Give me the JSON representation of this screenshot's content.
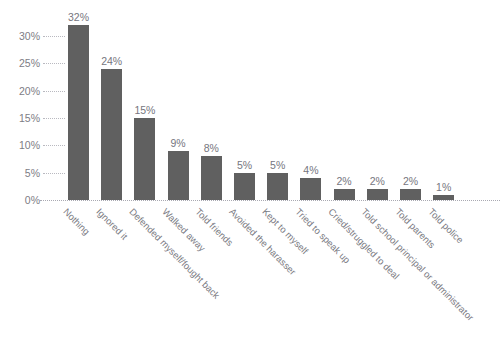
{
  "chart": {
    "title_remnant": "",
    "background_color": "#ffffff",
    "bar_color": "#606060",
    "axis_text_color": "#7b7b83",
    "gridline_color": "#b9b9c0"
  },
  "chart_data": {
    "type": "bar",
    "title": "",
    "xlabel": "",
    "ylabel": "",
    "ylim": [
      0,
      32
    ],
    "grid": "dotted-stubs-and-zero-baseline",
    "legend": "none",
    "orientation": "vertical",
    "value_suffix": "%",
    "categories": [
      "Nothing",
      "Ignored it",
      "Defended myself/fought back",
      "Walked away",
      "Told friends",
      "Avoided the harasser",
      "Kept to myself",
      "Tried to speak up",
      "Cried/struggled to deal",
      "Told school principal or administrator",
      "Told parents",
      "Told police"
    ],
    "values": [
      32,
      24,
      15,
      9,
      8,
      5,
      5,
      4,
      2,
      2,
      2,
      1
    ],
    "value_labels": [
      "32%",
      "24%",
      "15%",
      "9%",
      "8%",
      "5%",
      "5%",
      "4%",
      "2%",
      "2%",
      "2%",
      "1%"
    ],
    "yticks": [
      0,
      5,
      10,
      15,
      20,
      25,
      30
    ],
    "ytick_labels": [
      "0%",
      "5%",
      "10%",
      "15%",
      "20%",
      "25%",
      "30%"
    ]
  }
}
